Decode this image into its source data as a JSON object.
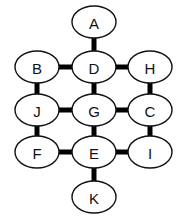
{
  "diagram": {
    "type": "graph",
    "nodes": [
      {
        "id": "A",
        "label": "A",
        "cx": 94,
        "cy": 22
      },
      {
        "id": "B",
        "label": "B",
        "cx": 37,
        "cy": 67
      },
      {
        "id": "D",
        "label": "D",
        "cx": 94,
        "cy": 67
      },
      {
        "id": "H",
        "label": "H",
        "cx": 150,
        "cy": 67
      },
      {
        "id": "J",
        "label": "J",
        "cx": 37,
        "cy": 110
      },
      {
        "id": "G",
        "label": "G",
        "cx": 94,
        "cy": 110
      },
      {
        "id": "C",
        "label": "C",
        "cx": 150,
        "cy": 110
      },
      {
        "id": "F",
        "label": "F",
        "cx": 37,
        "cy": 152
      },
      {
        "id": "E",
        "label": "E",
        "cx": 94,
        "cy": 152
      },
      {
        "id": "I",
        "label": "I",
        "cx": 150,
        "cy": 152
      },
      {
        "id": "K",
        "label": "K",
        "cx": 94,
        "cy": 197
      }
    ],
    "edges": [
      [
        "A",
        "D"
      ],
      [
        "B",
        "D"
      ],
      [
        "D",
        "H"
      ],
      [
        "B",
        "J"
      ],
      [
        "D",
        "G"
      ],
      [
        "H",
        "C"
      ],
      [
        "J",
        "G"
      ],
      [
        "G",
        "C"
      ],
      [
        "J",
        "F"
      ],
      [
        "G",
        "E"
      ],
      [
        "C",
        "I"
      ],
      [
        "F",
        "E"
      ],
      [
        "E",
        "I"
      ],
      [
        "E",
        "K"
      ]
    ],
    "node_rx": 22,
    "node_ry": 16
  }
}
